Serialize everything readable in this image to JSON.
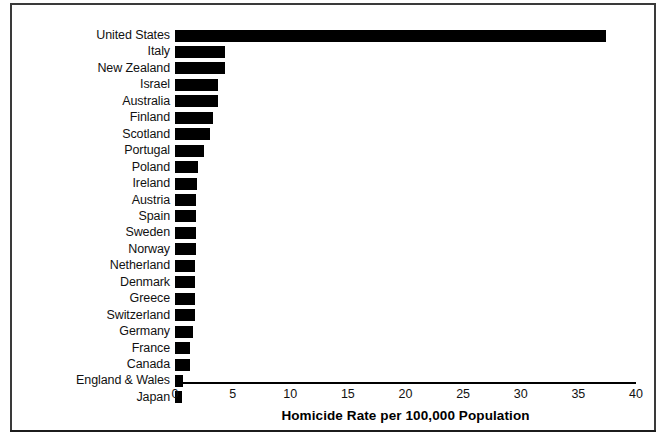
{
  "chart_data": {
    "type": "bar",
    "orientation": "horizontal",
    "title": "",
    "xlabel": "Homicide Rate per 100,000 Population",
    "ylabel": "",
    "xlim": [
      0,
      40
    ],
    "xticks": [
      0,
      5,
      10,
      15,
      20,
      25,
      30,
      35,
      40
    ],
    "grid": false,
    "legend": null,
    "bar_color": "#000000",
    "categories": [
      "United States",
      "Italy",
      "New Zealand",
      "Israel",
      "Australia",
      "Finland",
      "Scotland",
      "Portugal",
      "Poland",
      "Ireland",
      "Austria",
      "Spain",
      "Sweden",
      "Norway",
      "Netherland",
      "Denmark",
      "Greece",
      "Switzerland",
      "Germany",
      "France",
      "Canada",
      "England & Wales",
      "Japan"
    ],
    "values": [
      37.4,
      4.3,
      4.3,
      3.7,
      3.7,
      3.3,
      3.0,
      2.5,
      2.0,
      1.9,
      1.8,
      1.8,
      1.8,
      1.8,
      1.7,
      1.7,
      1.7,
      1.7,
      1.6,
      1.3,
      1.3,
      0.7,
      0.6
    ]
  }
}
